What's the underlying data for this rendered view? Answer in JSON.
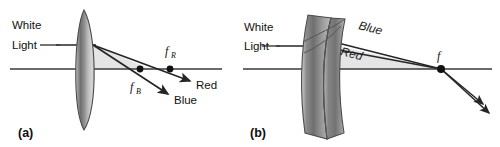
{
  "figure": {
    "background_color": "#ffffff",
    "ink_color": "#262626",
    "shade_color": "#e3e3e3",
    "width": 500,
    "height": 147
  },
  "panel_a": {
    "caption": "(a)",
    "source_label_line1": "White",
    "source_label_line2": "Light",
    "focal_red": {
      "symbol": "f",
      "subscript": "R"
    },
    "focal_blue": {
      "symbol": "f",
      "subscript": "B"
    },
    "ray_red_label": "Red",
    "ray_blue_label": "Blue",
    "lens_type": "biconvex-converging"
  },
  "panel_b": {
    "caption": "(b)",
    "source_label_line1": "White",
    "source_label_line2": "Light",
    "focal_point": "f",
    "ray_blue_label": "Blue",
    "ray_red_label": "Red",
    "lens_type": "achromatic-doublet"
  }
}
